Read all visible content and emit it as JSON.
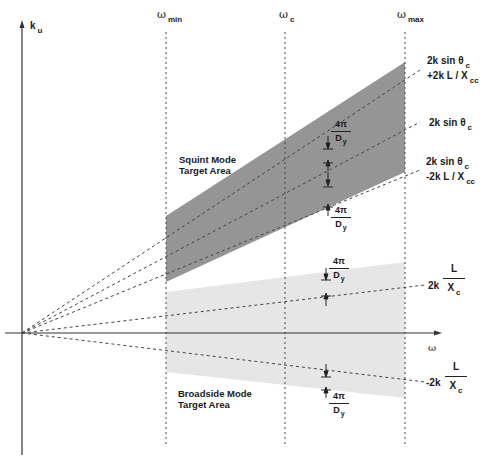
{
  "diagram": {
    "axes": {
      "y_label": "k",
      "y_label_sub": "u",
      "x_label": "ω"
    },
    "frequency_markers": [
      {
        "symbol": "ω",
        "sub": "min"
      },
      {
        "symbol": "ω",
        "sub": "c"
      },
      {
        "symbol": "ω",
        "sub": "max"
      }
    ],
    "line_labels": {
      "upper_line_1": "2k sin θ",
      "upper_line_1_sub": "c",
      "upper_line_2": "+2k L / X",
      "upper_line_2_sub": "cc",
      "center_line": "2k sin θ",
      "center_line_sub": "c",
      "lower_line_1": "2k sin θ",
      "lower_line_1_sub": "c",
      "lower_line_2": "-2k L /  X",
      "lower_line_2_sub": "cc",
      "broadside_upper_prefix": "2k",
      "broadside_upper_num": "L",
      "broadside_upper_den": "X",
      "broadside_upper_den_sub": "c",
      "broadside_lower_prefix": "-2k",
      "broadside_lower_num": "L",
      "broadside_lower_den": "X",
      "broadside_lower_den_sub": "c"
    },
    "spacing_annotation": {
      "numerator": "4π",
      "denominator": "D",
      "denominator_sub": "y"
    },
    "regions": {
      "squint_line1": "Squint Mode",
      "squint_line2": "Target Area",
      "broadside_line1": "Broadside Mode",
      "broadside_line2": "Target Area"
    },
    "colors": {
      "squint_fill": "#8f8f8f",
      "broadside_fill": "#e4e4e4",
      "line": "#333333"
    }
  }
}
